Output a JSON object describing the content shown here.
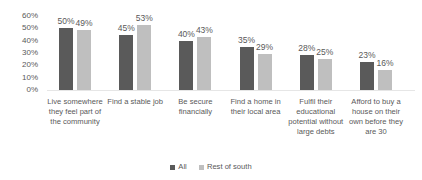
{
  "chart_data": {
    "type": "bar",
    "title": "",
    "xlabel": "",
    "ylabel": "",
    "ylim": [
      0,
      60
    ],
    "yticks": [
      "0%",
      "10%",
      "20%",
      "30%",
      "40%",
      "50%",
      "60%"
    ],
    "grid": false,
    "legend_position": "bottom",
    "categories": [
      "Live somewhere they feel part of the community",
      "Find a stable job",
      "Be secure financially",
      "Find a home in their local area",
      "Fulfil their educational potential without large debts",
      "Afford to buy a house on their own before they are 30"
    ],
    "series": [
      {
        "name": "All",
        "color": "#5a5a5a",
        "values": [
          50,
          45,
          40,
          35,
          28,
          23
        ],
        "labels": [
          "50%",
          "45%",
          "40%",
          "35%",
          "28%",
          "23%"
        ]
      },
      {
        "name": "Rest of south",
        "color": "#bfbfbf",
        "values": [
          49,
          53,
          43,
          29,
          25,
          16
        ],
        "labels": [
          "49%",
          "53%",
          "43%",
          "29%",
          "25%",
          "16%"
        ]
      }
    ]
  }
}
